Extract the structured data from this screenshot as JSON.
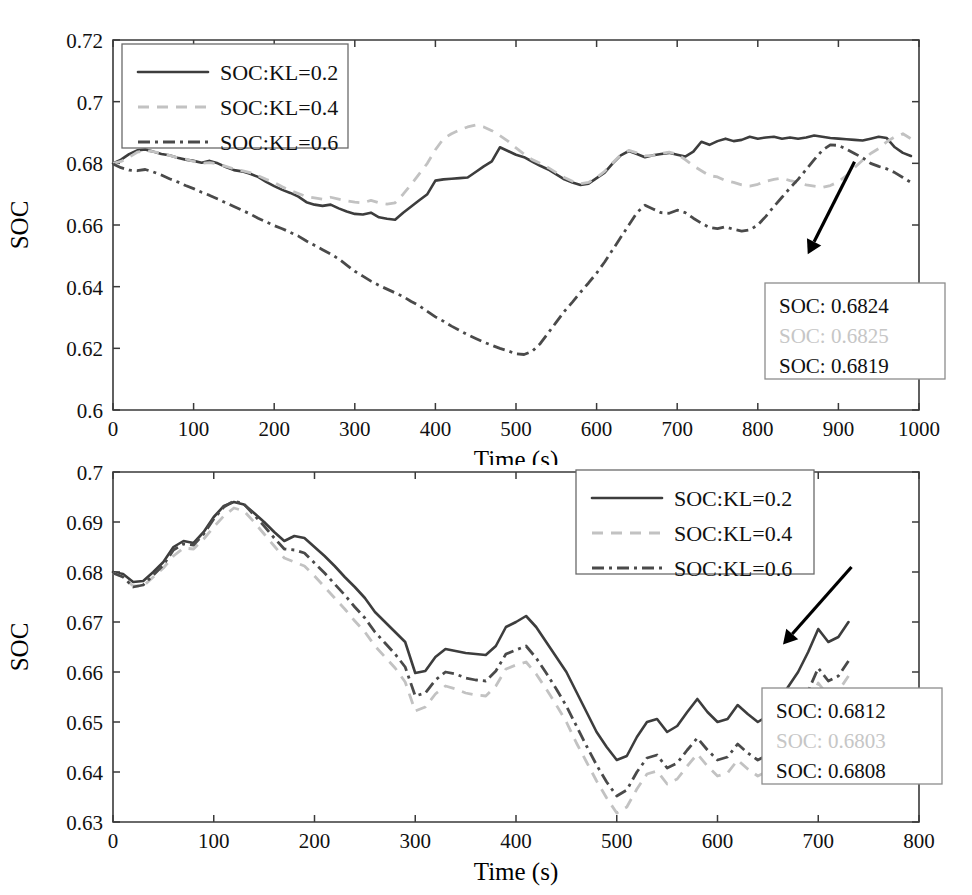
{
  "figure": {
    "title": "",
    "panels": [
      "top",
      "bottom"
    ]
  },
  "chart_data": [
    {
      "id": "top",
      "type": "line",
      "title": "",
      "xlabel": "Time (s)",
      "ylabel": "SOC",
      "xlim": [
        0,
        1000
      ],
      "ylim": [
        0.6,
        0.72
      ],
      "xticks": [
        0,
        100,
        200,
        300,
        400,
        500,
        600,
        700,
        800,
        900,
        1000
      ],
      "yticks": [
        0.6,
        0.62,
        0.64,
        0.66,
        0.68,
        0.7,
        0.72
      ],
      "xtick_labels": [
        "0",
        "100",
        "200",
        "300",
        "400",
        "500",
        "600",
        "700",
        "800",
        "900",
        "1000"
      ],
      "ytick_labels": [
        "0.6",
        "0.62",
        "0.64",
        "0.66",
        "0.68",
        "0.7",
        "0.72"
      ],
      "grid": false,
      "legend_position": "upper-left",
      "legend": [
        "SOC:KL=0.2",
        "SOC:KL=0.4",
        "SOC:KL=0.6"
      ],
      "annotation": {
        "lines": [
          "SOC: 0.6824",
          "SOC: 0.6825",
          "SOC: 0.6819"
        ],
        "arrow_from": [
          920,
          0.6805
        ],
        "arrow_to": [
          862,
          0.6505
        ]
      },
      "x": [
        0,
        10,
        20,
        30,
        40,
        50,
        60,
        70,
        80,
        90,
        100,
        110,
        120,
        130,
        140,
        150,
        160,
        170,
        180,
        190,
        200,
        210,
        220,
        230,
        240,
        250,
        260,
        270,
        280,
        290,
        300,
        310,
        320,
        330,
        340,
        350,
        360,
        370,
        380,
        390,
        400,
        410,
        420,
        430,
        440,
        450,
        460,
        470,
        480,
        490,
        500,
        510,
        520,
        530,
        540,
        550,
        560,
        570,
        580,
        590,
        600,
        610,
        620,
        630,
        640,
        650,
        660,
        670,
        680,
        690,
        700,
        710,
        720,
        730,
        740,
        750,
        760,
        770,
        780,
        790,
        800,
        810,
        820,
        830,
        840,
        850,
        860,
        870,
        880,
        890,
        900,
        910,
        920,
        930,
        940,
        950,
        960,
        970,
        980,
        990
      ],
      "series": [
        {
          "name": "SOC:KL=0.2",
          "style": "solid",
          "color": "#3d3d3d",
          "values": [
            0.68,
            0.6812,
            0.683,
            0.6842,
            0.6845,
            0.6838,
            0.683,
            0.6826,
            0.6818,
            0.6812,
            0.6808,
            0.6802,
            0.6808,
            0.68,
            0.6788,
            0.6778,
            0.6774,
            0.6766,
            0.6756,
            0.674,
            0.6726,
            0.6714,
            0.6704,
            0.6692,
            0.6674,
            0.6666,
            0.6662,
            0.6666,
            0.6654,
            0.6644,
            0.6636,
            0.6634,
            0.664,
            0.6625,
            0.662,
            0.6617,
            0.664,
            0.666,
            0.668,
            0.67,
            0.6744,
            0.6748,
            0.675,
            0.6752,
            0.6754,
            0.6772,
            0.679,
            0.6806,
            0.6852,
            0.684,
            0.6828,
            0.682,
            0.6806,
            0.6792,
            0.678,
            0.6764,
            0.6748,
            0.6738,
            0.673,
            0.6734,
            0.6752,
            0.677,
            0.68,
            0.6826,
            0.684,
            0.683,
            0.682,
            0.6826,
            0.683,
            0.6834,
            0.6828,
            0.6822,
            0.6838,
            0.687,
            0.686,
            0.6872,
            0.688,
            0.6872,
            0.6876,
            0.6886,
            0.688,
            0.6884,
            0.6886,
            0.688,
            0.6884,
            0.688,
            0.6884,
            0.689,
            0.6886,
            0.6882,
            0.688,
            0.6878,
            0.6876,
            0.6874,
            0.688,
            0.6886,
            0.6882,
            0.6852,
            0.6834,
            0.6824
          ]
        },
        {
          "name": "SOC:KL=0.4",
          "style": "dashed",
          "color": "#c2c2c2",
          "values": [
            0.68,
            0.6806,
            0.682,
            0.6836,
            0.6842,
            0.6838,
            0.6832,
            0.6826,
            0.6818,
            0.6814,
            0.6806,
            0.68,
            0.6802,
            0.6798,
            0.679,
            0.6782,
            0.6776,
            0.677,
            0.676,
            0.6748,
            0.6738,
            0.6724,
            0.6712,
            0.6702,
            0.6692,
            0.6688,
            0.6684,
            0.669,
            0.6684,
            0.6678,
            0.6674,
            0.6672,
            0.668,
            0.6672,
            0.6668,
            0.6672,
            0.67,
            0.6732,
            0.6766,
            0.68,
            0.6844,
            0.688,
            0.6896,
            0.6908,
            0.6918,
            0.6924,
            0.6918,
            0.6906,
            0.689,
            0.6872,
            0.685,
            0.683,
            0.6812,
            0.68,
            0.6786,
            0.677,
            0.6754,
            0.6742,
            0.6734,
            0.6738,
            0.6754,
            0.6774,
            0.6802,
            0.6828,
            0.6842,
            0.6834,
            0.6824,
            0.6826,
            0.6832,
            0.6836,
            0.683,
            0.6812,
            0.6792,
            0.6776,
            0.676,
            0.6756,
            0.6744,
            0.6738,
            0.673,
            0.6726,
            0.6732,
            0.6742,
            0.6748,
            0.6752,
            0.6744,
            0.6738,
            0.673,
            0.6726,
            0.6722,
            0.6728,
            0.674,
            0.676,
            0.6786,
            0.681,
            0.6832,
            0.6848,
            0.687,
            0.6886,
            0.6896,
            0.688,
            0.686,
            0.684
          ]
        },
        {
          "name": "SOC:KL=0.6",
          "style": "dashdot",
          "color": "#4a4a4a",
          "values": [
            0.6798,
            0.6786,
            0.6778,
            0.6776,
            0.678,
            0.6772,
            0.6762,
            0.675,
            0.674,
            0.6728,
            0.6718,
            0.6706,
            0.6696,
            0.6684,
            0.6672,
            0.666,
            0.6648,
            0.6636,
            0.6622,
            0.661,
            0.6598,
            0.6588,
            0.6576,
            0.6564,
            0.6548,
            0.6534,
            0.652,
            0.6506,
            0.649,
            0.647,
            0.645,
            0.6434,
            0.6418,
            0.6404,
            0.6392,
            0.638,
            0.6368,
            0.6352,
            0.6338,
            0.632,
            0.6302,
            0.6288,
            0.6272,
            0.6258,
            0.6244,
            0.6232,
            0.622,
            0.621,
            0.62,
            0.6192,
            0.6182,
            0.618,
            0.619,
            0.6215,
            0.625,
            0.6285,
            0.632,
            0.635,
            0.6382,
            0.6412,
            0.6444,
            0.648,
            0.652,
            0.656,
            0.66,
            0.664,
            0.6664,
            0.6652,
            0.664,
            0.6638,
            0.6648,
            0.664,
            0.6622,
            0.6606,
            0.6592,
            0.6588,
            0.6594,
            0.6586,
            0.658,
            0.6584,
            0.66,
            0.6628,
            0.666,
            0.669,
            0.672,
            0.6748,
            0.678,
            0.6812,
            0.6842,
            0.686,
            0.6858,
            0.6846,
            0.6832,
            0.6818,
            0.68,
            0.679,
            0.6782,
            0.677,
            0.6754,
            0.6738
          ]
        }
      ]
    },
    {
      "id": "bottom",
      "type": "line",
      "title": "",
      "xlabel": "Time (s)",
      "ylabel": "SOC",
      "xlim": [
        0,
        800
      ],
      "ylim": [
        0.63,
        0.7
      ],
      "xticks": [
        0,
        100,
        200,
        300,
        400,
        500,
        600,
        700,
        800
      ],
      "yticks": [
        0.63,
        0.64,
        0.65,
        0.66,
        0.67,
        0.68,
        0.69,
        0.7
      ],
      "xtick_labels": [
        "0",
        "100",
        "200",
        "300",
        "400",
        "500",
        "600",
        "700",
        "800"
      ],
      "ytick_labels": [
        "0.63",
        "0.64",
        "0.65",
        "0.66",
        "0.67",
        "0.68",
        "0.69",
        "0.7"
      ],
      "grid": false,
      "legend_position": "upper-right",
      "legend": [
        "SOC:KL=0.2",
        "SOC:KL=0.4",
        "SOC:KL=0.6"
      ],
      "annotation": {
        "lines": [
          "SOC: 0.6812",
          "SOC: 0.6803",
          "SOC: 0.6808"
        ],
        "arrow_from": [
          733,
          0.681
        ],
        "arrow_to": [
          665,
          0.6655
        ]
      },
      "x": [
        0,
        10,
        20,
        30,
        40,
        50,
        60,
        70,
        80,
        90,
        100,
        110,
        120,
        130,
        140,
        150,
        160,
        170,
        180,
        190,
        200,
        210,
        220,
        230,
        240,
        250,
        260,
        270,
        280,
        290,
        300,
        310,
        320,
        330,
        340,
        350,
        360,
        370,
        380,
        390,
        400,
        410,
        420,
        430,
        440,
        450,
        460,
        470,
        480,
        490,
        500,
        510,
        520,
        530,
        540,
        550,
        560,
        570,
        580,
        590,
        600,
        610,
        620,
        630,
        640,
        650,
        660,
        670,
        680,
        690,
        700,
        710,
        720,
        730
      ],
      "series": [
        {
          "name": "SOC:KL=0.2",
          "style": "solid",
          "color": "#3d3d3d",
          "values": [
            0.68,
            0.6796,
            0.678,
            0.6782,
            0.68,
            0.682,
            0.685,
            0.6862,
            0.6858,
            0.688,
            0.691,
            0.6932,
            0.694,
            0.6935,
            0.6918,
            0.69,
            0.688,
            0.6862,
            0.6872,
            0.6868,
            0.685,
            0.6832,
            0.6812,
            0.679,
            0.677,
            0.6748,
            0.672,
            0.67,
            0.668,
            0.666,
            0.6598,
            0.6602,
            0.663,
            0.6646,
            0.6642,
            0.6638,
            0.6636,
            0.6634,
            0.6652,
            0.669,
            0.67,
            0.6712,
            0.669,
            0.666,
            0.663,
            0.66,
            0.656,
            0.652,
            0.648,
            0.645,
            0.6424,
            0.6432,
            0.647,
            0.65,
            0.6506,
            0.648,
            0.6492,
            0.652,
            0.6546,
            0.652,
            0.65,
            0.6506,
            0.6534,
            0.6516,
            0.65,
            0.6512,
            0.654,
            0.657,
            0.66,
            0.664,
            0.6686,
            0.666,
            0.667,
            0.67,
            0.6694,
            0.6668,
            0.668,
            0.672,
            0.675,
            0.674,
            0.676,
            0.678,
            0.6812
          ]
        },
        {
          "name": "SOC:KL=0.4",
          "style": "dashed",
          "color": "#c2c2c2",
          "values": [
            0.6798,
            0.679,
            0.6772,
            0.6772,
            0.679,
            0.6808,
            0.6832,
            0.6848,
            0.6846,
            0.6866,
            0.689,
            0.6912,
            0.6928,
            0.6922,
            0.69,
            0.6876,
            0.6852,
            0.6828,
            0.682,
            0.6812,
            0.6792,
            0.677,
            0.6748,
            0.6726,
            0.6702,
            0.668,
            0.6652,
            0.663,
            0.6608,
            0.658,
            0.6522,
            0.653,
            0.6556,
            0.6572,
            0.6566,
            0.6558,
            0.6554,
            0.6552,
            0.6572,
            0.6606,
            0.6614,
            0.662,
            0.6596,
            0.6566,
            0.6534,
            0.65,
            0.6458,
            0.642,
            0.6382,
            0.6348,
            0.6318,
            0.633,
            0.6366,
            0.6396,
            0.6402,
            0.6376,
            0.6386,
            0.6412,
            0.6436,
            0.6412,
            0.6392,
            0.6398,
            0.6424,
            0.6406,
            0.6392,
            0.6402,
            0.6428,
            0.6458,
            0.649,
            0.653,
            0.6578,
            0.6552,
            0.6562,
            0.6592,
            0.6586,
            0.6562,
            0.6574,
            0.6614,
            0.6644,
            0.6634,
            0.6656,
            0.6676,
            0.6803
          ]
        },
        {
          "name": "SOC:KL=0.6",
          "style": "dashdot",
          "color": "#4a4a4a",
          "values": [
            0.6798,
            0.679,
            0.677,
            0.6774,
            0.6794,
            0.6814,
            0.6844,
            0.6856,
            0.6854,
            0.6876,
            0.6906,
            0.693,
            0.6942,
            0.6936,
            0.6914,
            0.6892,
            0.6868,
            0.6846,
            0.6844,
            0.6838,
            0.6818,
            0.6798,
            0.6776,
            0.6754,
            0.673,
            0.6708,
            0.668,
            0.6658,
            0.6636,
            0.661,
            0.6552,
            0.6558,
            0.6584,
            0.66,
            0.6596,
            0.6588,
            0.6584,
            0.6582,
            0.6602,
            0.6636,
            0.6644,
            0.6652,
            0.6628,
            0.6598,
            0.6566,
            0.6532,
            0.6492,
            0.6452,
            0.6414,
            0.638,
            0.6352,
            0.6364,
            0.64,
            0.6428,
            0.6434,
            0.6408,
            0.6418,
            0.6444,
            0.6468,
            0.6444,
            0.6424,
            0.643,
            0.6456,
            0.6438,
            0.6424,
            0.6434,
            0.646,
            0.649,
            0.6522,
            0.6562,
            0.6608,
            0.6582,
            0.6592,
            0.6622,
            0.6616,
            0.6592,
            0.6604,
            0.6644,
            0.6674,
            0.6664,
            0.6686,
            0.6706,
            0.6808
          ]
        }
      ]
    }
  ]
}
